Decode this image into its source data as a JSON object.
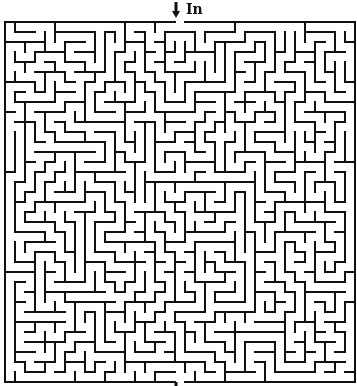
{
  "entrance": {
    "label": "In",
    "icon": "down-arrow-icon",
    "side": "top",
    "column": 17
  },
  "exit": {
    "icon": "down-arrow-icon",
    "side": "bottom",
    "column": 17
  },
  "maze": {
    "columns": 35,
    "rows": 36,
    "cell_size": 10,
    "origin_x": 5,
    "origin_y": 22,
    "wall_width": 2,
    "wall_color": "#111111",
    "background": "#ffffff",
    "seed": 28
  }
}
